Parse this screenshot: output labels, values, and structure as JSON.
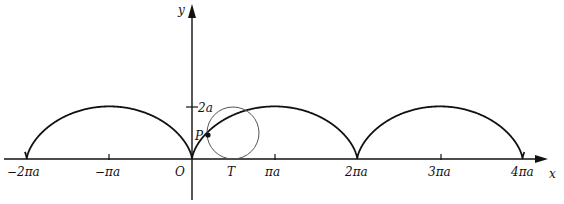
{
  "diagram": {
    "axes": {
      "x_label": "x",
      "y_label": "y",
      "origin_label": "O"
    },
    "x_ticks": [
      {
        "label": "−2πa",
        "value": -2
      },
      {
        "label": "−πa",
        "value": -1
      },
      {
        "label": "πa",
        "value": 1
      },
      {
        "label": "2πa",
        "value": 2
      },
      {
        "label": "3πa",
        "value": 3
      },
      {
        "label": "4πa",
        "value": 4
      }
    ],
    "y_ticks": [
      {
        "label": "2a",
        "value": 2
      }
    ],
    "point_label": "P",
    "tangent_point_label": "T",
    "colors": {
      "curve": "#111111",
      "axis": "#111111",
      "circle": "#555555"
    }
  }
}
